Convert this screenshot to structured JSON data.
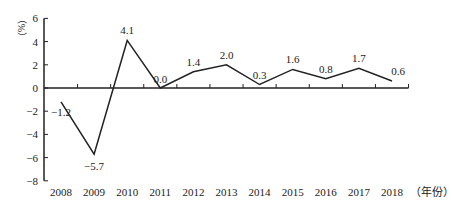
{
  "chart_data": {
    "type": "line",
    "title": "",
    "xlabel": "（年份）",
    "ylabel": "（%）",
    "categories": [
      "2008",
      "2009",
      "2010",
      "2011",
      "2012",
      "2013",
      "2014",
      "2015",
      "2016",
      "2017",
      "2018"
    ],
    "series": [
      {
        "name": "growth",
        "values": [
          -1.2,
          -5.7,
          4.1,
          0.0,
          1.4,
          2.0,
          0.3,
          1.6,
          0.8,
          1.7,
          0.6
        ]
      }
    ],
    "data_labels": [
      "-1.2",
      "-5.7",
      "4.1",
      "0.0",
      "1.4",
      "2.0",
      "0.3",
      "1.6",
      "0.8",
      "1.7",
      "0.6"
    ],
    "yticks": [
      6,
      4,
      2,
      0,
      -2,
      -4,
      -6,
      -8
    ],
    "ytick_labels": [
      "6",
      "4",
      "2",
      "0",
      "−2",
      "−4",
      "−6",
      "−8"
    ],
    "ylim": [
      -8,
      6
    ],
    "grid": false,
    "legend": "none"
  }
}
